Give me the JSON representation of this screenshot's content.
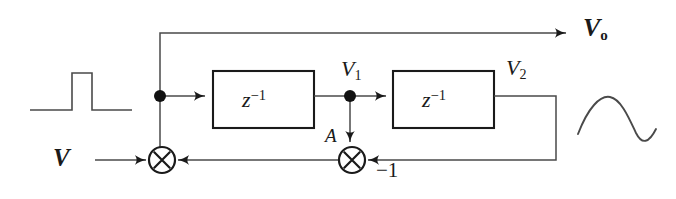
{
  "diagram": {
    "type": "block-diagram",
    "canvas": {
      "width": 676,
      "height": 199
    },
    "colors": {
      "background": "#ffffff",
      "stroke": "#3a3a3a",
      "stroke_heavy": "#1a1a1a",
      "node_fill": "#111111",
      "text": "#1a1a1a"
    },
    "labels": {
      "input": "V",
      "output": "V",
      "output_sub": "o",
      "node1": "V",
      "node1_sub": "1",
      "node2": "V",
      "node2_sub": "2",
      "tap": "A",
      "gain": "−1",
      "delay1": "z",
      "delay1_sup": "−1",
      "delay2": "z",
      "delay2_sup": "−1"
    },
    "blocks": [
      {
        "name": "delay-block-1",
        "text": "z",
        "superscript": "−1",
        "x": 213,
        "y": 71,
        "width": 101,
        "height": 57
      },
      {
        "name": "delay-block-2",
        "text": "z",
        "superscript": "−1",
        "x": 393,
        "y": 71,
        "width": 101,
        "height": 57
      }
    ],
    "adders": [
      {
        "name": "summing-junction-input",
        "cx": 162,
        "cy": 160,
        "r": 13
      },
      {
        "name": "summing-junction-feedback",
        "cx": 352,
        "cy": 160,
        "r": 13
      }
    ],
    "nodes": [
      {
        "name": "branch-node-1",
        "cx": 160,
        "cy": 96,
        "r": 6
      },
      {
        "name": "branch-node-2",
        "cx": 350,
        "cy": 96,
        "r": 6
      }
    ],
    "waveforms": {
      "input_pulse": {
        "name": "input-pulse-waveform",
        "description": "rectangular pulse"
      },
      "output_sine": {
        "name": "output-sine-waveform",
        "description": "one cycle sinusoid"
      }
    }
  }
}
